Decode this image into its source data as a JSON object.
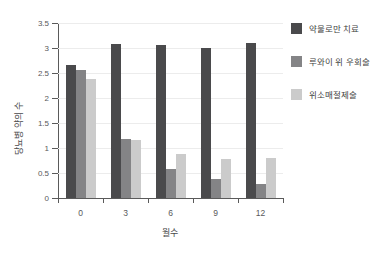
{
  "chart_data": {
    "type": "bar",
    "title": "",
    "xlabel": "월수",
    "ylabel": "당뇨병 약의 수",
    "categories": [
      "0",
      "3",
      "6",
      "9",
      "12"
    ],
    "series": [
      {
        "name": "약물로만 치료",
        "color": "#4a4a4c",
        "values": [
          2.67,
          3.08,
          3.07,
          3.01,
          3.11
        ]
      },
      {
        "name": "루와이 위 우회술",
        "color": "#848486",
        "values": [
          2.57,
          1.18,
          0.58,
          0.38,
          0.29
        ]
      },
      {
        "name": "위소매절제술",
        "color": "#cbcbcb",
        "values": [
          2.38,
          1.17,
          0.88,
          0.78,
          0.81
        ]
      }
    ],
    "ylim": [
      0,
      3.5
    ],
    "yticks": [
      "0",
      "0.5",
      "1",
      "1.5",
      "2",
      "2.5",
      "3",
      "3.5"
    ],
    "ytick_values": [
      0,
      0.5,
      1,
      1.5,
      2,
      2.5,
      3,
      3.5
    ],
    "grid": true,
    "legend_position": "right"
  }
}
